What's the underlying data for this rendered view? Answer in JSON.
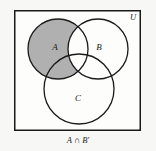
{
  "figure": {
    "title_caption": "A ∩ B′",
    "universe_label": "U",
    "background_color": "#f7f7f5",
    "stroke_color": "#1a1a1a",
    "shade_color": "#b0b0b0",
    "fill_color": "#fdfdfc",
    "universe_rect": {
      "x": 14,
      "y": 10,
      "width": 127,
      "height": 121
    },
    "sets": [
      {
        "label": "A",
        "cx": 58,
        "cy": 49,
        "r": 30,
        "label_x": 55,
        "label_y": 50,
        "shaded": true
      },
      {
        "label": "B",
        "cx": 98,
        "cy": 49,
        "r": 30,
        "label_x": 99,
        "label_y": 50,
        "shaded": false
      },
      {
        "label": "C",
        "cx": 79,
        "cy": 89,
        "r": 35,
        "label_x": 78,
        "label_y": 101,
        "shaded": false
      }
    ],
    "shaded_region_description": "A ∩ B′",
    "universe_label_pos": {
      "x": 133,
      "y": 20
    },
    "caption_pos": {
      "x": 78,
      "y": 143
    }
  }
}
